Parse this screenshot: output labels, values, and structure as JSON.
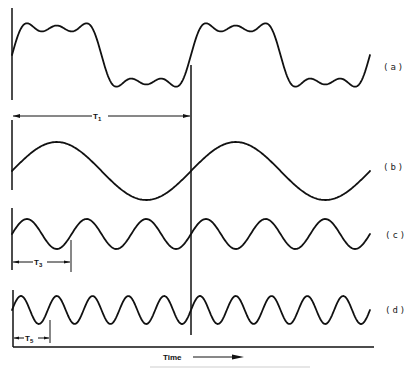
{
  "figure": {
    "waveforms": [
      {
        "id": "a",
        "label": "(a)",
        "description": "complex periodic wave (sum of fundamental + 3rd + 5th harmonics)"
      },
      {
        "id": "b",
        "label": "(b)",
        "description": "fundamental sine, period T1"
      },
      {
        "id": "c",
        "label": "(c)",
        "description": "3rd harmonic sine, period T3"
      },
      {
        "id": "d",
        "label": "(d)",
        "description": "5th harmonic sine, period T5"
      }
    ],
    "periods": {
      "t1": {
        "label": "T",
        "sub": "1"
      },
      "t3": {
        "label": "T",
        "sub": "3"
      },
      "t5": {
        "label": "T",
        "sub": "5"
      }
    },
    "axis": {
      "label": "Time"
    },
    "caption": "Figure caption text (illegible)"
  },
  "colors": {
    "ink": "#111111",
    "background": "#ffffff"
  }
}
